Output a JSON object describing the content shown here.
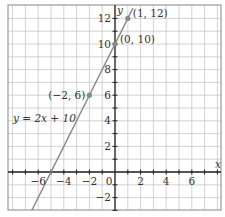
{
  "chart_data": {
    "type": "line",
    "title": "",
    "xlabel": "x",
    "ylabel": "y",
    "xlim": [
      -8.2,
      8.1
    ],
    "ylim": [
      -3,
      12.8
    ],
    "grid": true,
    "x_ticks": [
      -6,
      -4,
      -2,
      2,
      4,
      6
    ],
    "y_ticks": [
      -2,
      2,
      4,
      6,
      8,
      10,
      12
    ],
    "x_tick_labels": [
      "−6",
      "−4",
      "−2",
      "2",
      "4",
      "6"
    ],
    "y_tick_labels": [
      "−2",
      "2",
      "4",
      "6",
      "8",
      "10",
      "12"
    ],
    "origin_label": "0",
    "series": [
      {
        "name": "y = 2x + 10",
        "equation": "y = 2x + 10",
        "slope": 2,
        "intercept": 10,
        "x": [
          -6.5,
          1.4
        ],
        "y": [
          -3,
          12.8
        ]
      }
    ],
    "points": [
      {
        "x": -2,
        "y": 6,
        "label": "(−2, 6)"
      },
      {
        "x": 0,
        "y": 10,
        "label": "(0, 10)"
      },
      {
        "x": 1,
        "y": 12,
        "label": "(1, 12)"
      }
    ],
    "annotations": [
      {
        "text": "y = 2x + 10",
        "x": -5.5,
        "y": 4.2
      }
    ],
    "colors": {
      "line": "#8a8a8a",
      "points": "#8a8a8a",
      "axes": "#222222",
      "grid": "#c8c8c8",
      "frame": "#9a9a9a"
    }
  }
}
